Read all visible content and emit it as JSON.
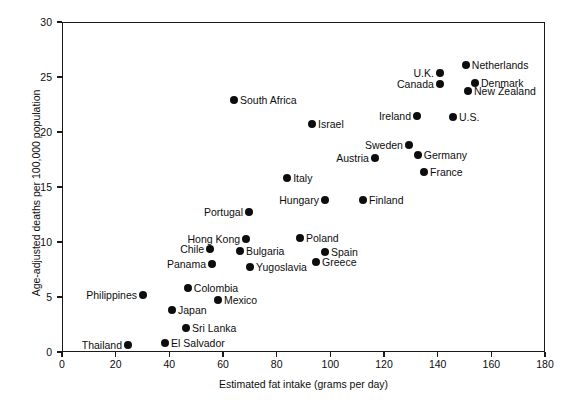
{
  "chart_data": {
    "type": "scatter",
    "title": "",
    "xlabel": "Estimated fat intake (grams per day)",
    "ylabel": "Age-adjusted deaths per 100,000 population",
    "xlim": [
      0,
      180
    ],
    "ylim": [
      0,
      30
    ],
    "xticks": [
      0,
      20,
      40,
      60,
      80,
      100,
      120,
      140,
      160,
      180
    ],
    "yticks": [
      0,
      5,
      10,
      15,
      20,
      25,
      30
    ],
    "grid": false,
    "legend": "none",
    "marker_color": "#0d0d0d",
    "axis_color": "#1a1a1a",
    "background": "#ffffff",
    "points": [
      {
        "label": "Netherlands",
        "x": 150.5,
        "y": 26.1,
        "side": "right"
      },
      {
        "label": "U.K.",
        "x": 140.8,
        "y": 25.4,
        "side": "left"
      },
      {
        "label": "Denmark",
        "x": 153.9,
        "y": 24.5,
        "side": "right"
      },
      {
        "label": "Canada",
        "x": 140.8,
        "y": 24.4,
        "side": "left"
      },
      {
        "label": "New Zealand",
        "x": 151.3,
        "y": 23.7,
        "side": "right"
      },
      {
        "label": "South Africa",
        "x": 64.1,
        "y": 22.9,
        "side": "right"
      },
      {
        "label": "Ireland",
        "x": 132.3,
        "y": 21.5,
        "side": "left"
      },
      {
        "label": "U.S.",
        "x": 145.7,
        "y": 21.4,
        "side": "right"
      },
      {
        "label": "Israel",
        "x": 93.2,
        "y": 20.7,
        "side": "right"
      },
      {
        "label": "Sweden",
        "x": 129.3,
        "y": 18.8,
        "side": "left"
      },
      {
        "label": "Germany",
        "x": 132.6,
        "y": 17.9,
        "side": "right"
      },
      {
        "label": "Austria",
        "x": 116.6,
        "y": 17.6,
        "side": "left"
      },
      {
        "label": "France",
        "x": 134.9,
        "y": 16.4,
        "side": "right"
      },
      {
        "label": "Italy",
        "x": 83.9,
        "y": 15.8,
        "side": "right"
      },
      {
        "label": "Hungary",
        "x": 98.0,
        "y": 13.8,
        "side": "left"
      },
      {
        "label": "Finland",
        "x": 112.2,
        "y": 13.8,
        "side": "right"
      },
      {
        "label": "Portugal",
        "x": 69.7,
        "y": 12.7,
        "side": "left"
      },
      {
        "label": "Poland",
        "x": 88.7,
        "y": 10.4,
        "side": "right"
      },
      {
        "label": "Hong Kong",
        "x": 68.6,
        "y": 10.3,
        "side": "left"
      },
      {
        "label": "Bulgaria",
        "x": 66.3,
        "y": 9.2,
        "side": "right"
      },
      {
        "label": "Chile",
        "x": 55.2,
        "y": 9.4,
        "side": "left"
      },
      {
        "label": "Spain",
        "x": 98.0,
        "y": 9.1,
        "side": "right"
      },
      {
        "label": "Panama",
        "x": 55.9,
        "y": 8.0,
        "side": "left"
      },
      {
        "label": "Greece",
        "x": 94.7,
        "y": 8.2,
        "side": "right"
      },
      {
        "label": "Yugoslavia",
        "x": 70.1,
        "y": 7.7,
        "side": "right"
      },
      {
        "label": "Colombia",
        "x": 46.9,
        "y": 5.8,
        "side": "right"
      },
      {
        "label": "Philippines",
        "x": 30.2,
        "y": 5.2,
        "side": "left"
      },
      {
        "label": "Mexico",
        "x": 58.1,
        "y": 4.7,
        "side": "right"
      },
      {
        "label": "Japan",
        "x": 41.0,
        "y": 3.8,
        "side": "right"
      },
      {
        "label": "Sri Lanka",
        "x": 46.2,
        "y": 2.2,
        "side": "right"
      },
      {
        "label": "El Salvador",
        "x": 38.4,
        "y": 0.8,
        "side": "right"
      },
      {
        "label": "Thailand",
        "x": 24.6,
        "y": 0.6,
        "side": "left"
      }
    ]
  }
}
